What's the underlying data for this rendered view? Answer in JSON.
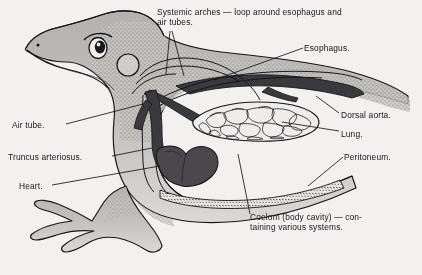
{
  "figure": {
    "background_color": "#f3f1ef",
    "ink_color": "#16161a",
    "body_fill_color": "#b8b6b2",
    "vessel_color": "#3a3a3e",
    "heart_color": "#4a484c",
    "width": 422,
    "height": 275
  },
  "labels": {
    "systemic_arches": "Systemic arches — loop around esophagus and\nair tubes.",
    "esophagus": "Esophagus.",
    "dorsal_aorta": "Dorsal aorta.",
    "lung": "Lung.",
    "peritoneum": "Peritoneum.",
    "air_tube": "Air tube.",
    "truncus_arteriosus": "Truncus arteriosus.",
    "heart": "Heart.",
    "coelom": "Coelom (body cavity) — con-\ntaining various systems."
  },
  "parts": [
    {
      "key": "systemic_arches",
      "name": "systemic-arches"
    },
    {
      "key": "esophagus",
      "name": "esophagus"
    },
    {
      "key": "dorsal_aorta",
      "name": "dorsal-aorta"
    },
    {
      "key": "lung",
      "name": "lung"
    },
    {
      "key": "peritoneum",
      "name": "peritoneum"
    },
    {
      "key": "air_tube",
      "name": "air-tube"
    },
    {
      "key": "truncus_arteriosus",
      "name": "truncus-arteriosus"
    },
    {
      "key": "heart",
      "name": "heart"
    },
    {
      "key": "coelom",
      "name": "coelom"
    }
  ]
}
